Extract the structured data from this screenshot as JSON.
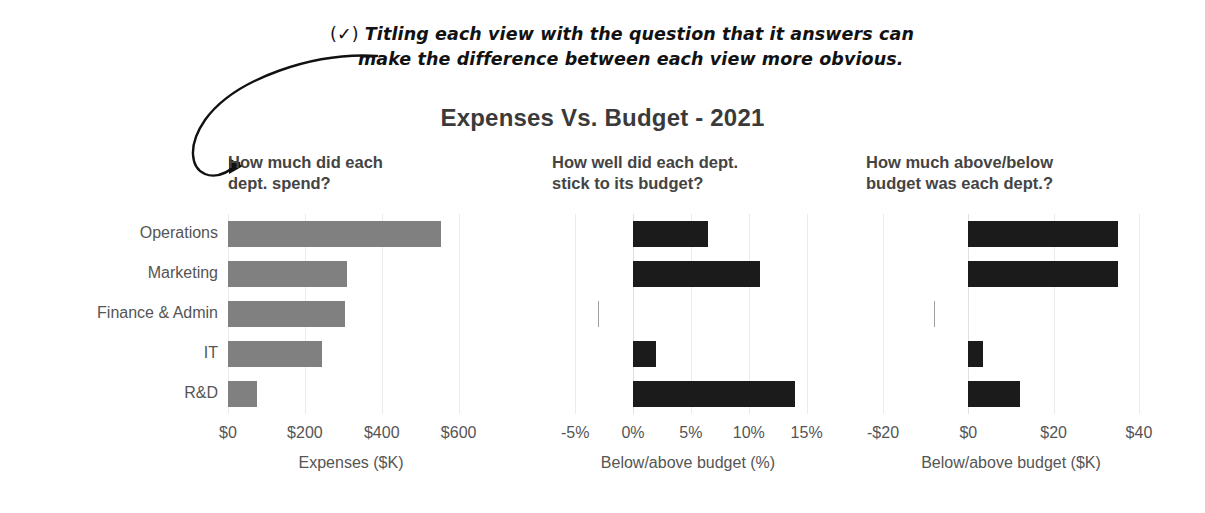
{
  "annotation": {
    "check_glyph": "(✓)",
    "line1": "Titling each view with the question that it answers can",
    "line2": "make the difference between each view more obvious.",
    "arrow": "curved-arrow-icon"
  },
  "chart": {
    "title": "Expenses Vs. Budget - 2021",
    "categories": [
      "Operations",
      "Marketing",
      "Finance & Admin",
      "IT",
      "R&D"
    ],
    "colors": {
      "gray_bar": "#808080",
      "dark_bar": "#1b1b1b",
      "light_gray_bar": "#a0a0a0",
      "text": "#555555",
      "title": "#3a3a3a",
      "gridline": "#eceaea"
    }
  },
  "chart_data": [
    {
      "type": "bar",
      "orientation": "horizontal",
      "title": "How much did each\ndept. spend?",
      "categories": [
        "Operations",
        "Marketing",
        "Finance & Admin",
        "IT",
        "R&D"
      ],
      "values": [
        555,
        310,
        305,
        245,
        75
      ],
      "xlabel": "Expenses ($K)",
      "ylabel": "",
      "xticks": [
        0,
        200,
        400,
        600
      ],
      "xticklabels": [
        "$0",
        "$200",
        "$400",
        "$600"
      ],
      "xlim": [
        0,
        640
      ],
      "grid": true,
      "legend": "none",
      "bar_color": "#808080"
    },
    {
      "type": "bar",
      "orientation": "horizontal",
      "title": "How well did each dept.\nstick to its budget?",
      "categories": [
        "Operations",
        "Marketing",
        "Finance & Admin",
        "IT",
        "R&D"
      ],
      "values": [
        6.5,
        11.0,
        -3.0,
        2.0,
        14.0
      ],
      "xlabel": "Below/above budget (%)",
      "ylabel": "",
      "xticks": [
        -5,
        0,
        5,
        10,
        15
      ],
      "xticklabels": [
        "-5%",
        "0%",
        "5%",
        "10%",
        "15%"
      ],
      "xlim": [
        -7,
        16.5
      ],
      "grid": true,
      "legend": "none",
      "bar_colors": [
        "#1b1b1b",
        "#1b1b1b",
        "#a0a0a0",
        "#1b1b1b",
        "#1b1b1b"
      ]
    },
    {
      "type": "bar",
      "orientation": "horizontal",
      "title": "How much above/below\nbudget was each dept.?",
      "categories": [
        "Operations",
        "Marketing",
        "Finance & Admin",
        "IT",
        "R&D"
      ],
      "values": [
        35,
        35,
        -8,
        3.5,
        12
      ],
      "xlabel": "Below/above budget ($K)",
      "ylabel": "",
      "xticks": [
        -20,
        0,
        20,
        40
      ],
      "xticklabels": [
        "-$20",
        "$0",
        "$20",
        "$40"
      ],
      "xlim": [
        -24,
        44
      ],
      "grid": true,
      "legend": "none",
      "bar_colors": [
        "#1b1b1b",
        "#1b1b1b",
        "#a0a0a0",
        "#1b1b1b",
        "#1b1b1b"
      ]
    }
  ]
}
